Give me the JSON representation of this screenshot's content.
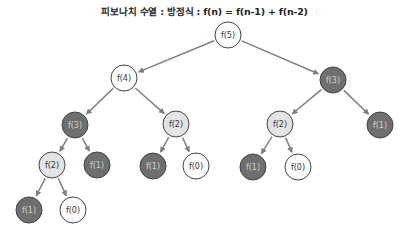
{
  "title": "피보나치 수열 : 방정식 : f(n) = f(n-1) + f(n-2)",
  "colors": {
    "white": "#ffffff",
    "light": "#e3e3e3",
    "dark": "#6f6f6f",
    "stroke": "#444444",
    "edge": "#7f7f7f",
    "text_default": "#333333",
    "text_on_dark": "#cfcfcf"
  },
  "nodes": [
    {
      "id": "n0",
      "label": "f(5)",
      "x": 228,
      "y": 35,
      "style": "white"
    },
    {
      "id": "n1",
      "label": "f(4)",
      "x": 124,
      "y": 78,
      "style": "white"
    },
    {
      "id": "n2",
      "label": "f(3)",
      "x": 333,
      "y": 80,
      "style": "dark"
    },
    {
      "id": "n3",
      "label": "f(3)",
      "x": 75,
      "y": 125,
      "style": "dark"
    },
    {
      "id": "n4",
      "label": "f(2)",
      "x": 176,
      "y": 124,
      "style": "light"
    },
    {
      "id": "n5",
      "label": "f(2)",
      "x": 280,
      "y": 124,
      "style": "light"
    },
    {
      "id": "n6",
      "label": "f(1)",
      "x": 380,
      "y": 125,
      "style": "dark"
    },
    {
      "id": "n7",
      "label": "f(2)",
      "x": 52,
      "y": 165,
      "style": "light"
    },
    {
      "id": "n8",
      "label": "f(1)",
      "x": 97,
      "y": 165,
      "style": "dark"
    },
    {
      "id": "n9",
      "label": "f(1)",
      "x": 153,
      "y": 166,
      "style": "dark"
    },
    {
      "id": "n10",
      "label": "f(0)",
      "x": 196,
      "y": 166,
      "style": "white"
    },
    {
      "id": "n11",
      "label": "f(1)",
      "x": 253,
      "y": 167,
      "style": "dark"
    },
    {
      "id": "n12",
      "label": "f(0)",
      "x": 298,
      "y": 167,
      "style": "white"
    },
    {
      "id": "n13",
      "label": "f(1)",
      "x": 29,
      "y": 210,
      "style": "dark"
    },
    {
      "id": "n14",
      "label": "f(0)",
      "x": 73,
      "y": 210,
      "style": "white"
    }
  ],
  "edges": [
    [
      "n0",
      "n1"
    ],
    [
      "n0",
      "n2"
    ],
    [
      "n1",
      "n3"
    ],
    [
      "n1",
      "n4"
    ],
    [
      "n2",
      "n5"
    ],
    [
      "n2",
      "n6"
    ],
    [
      "n3",
      "n7"
    ],
    [
      "n3",
      "n8"
    ],
    [
      "n4",
      "n9"
    ],
    [
      "n4",
      "n10"
    ],
    [
      "n5",
      "n11"
    ],
    [
      "n5",
      "n12"
    ],
    [
      "n7",
      "n13"
    ],
    [
      "n7",
      "n14"
    ]
  ]
}
